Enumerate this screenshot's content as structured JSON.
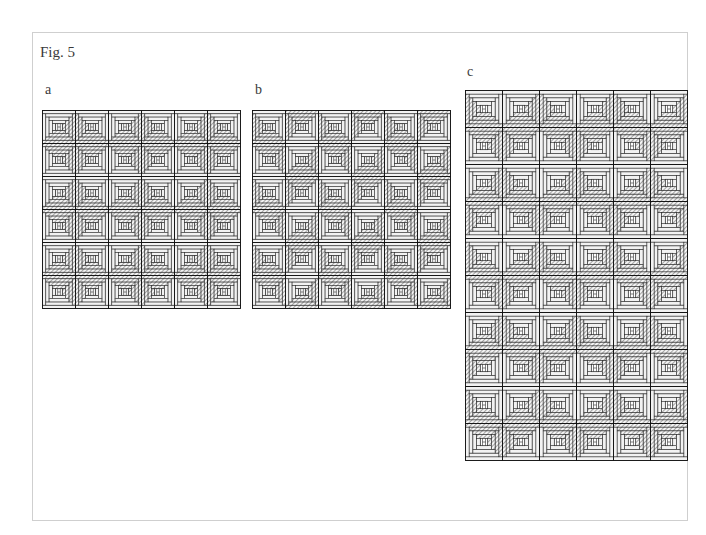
{
  "figure": {
    "title": "Fig. 5"
  },
  "colors": {
    "line": "#2a2a2a",
    "hatch": "#555555",
    "light": "#ffffff",
    "frame": "#cfcfcf"
  },
  "panels": [
    {
      "id": "a",
      "label": "a",
      "label_pos": {
        "x": 45,
        "y": 82
      },
      "pos": {
        "x": 42,
        "y": 110
      },
      "block_size": 33,
      "cols": 6,
      "rows": 6,
      "dark_corners": [
        [
          "br",
          "bl",
          "br",
          "bl",
          "br",
          "bl"
        ],
        [
          "tr",
          "tl",
          "tr",
          "tl",
          "tr",
          "tl"
        ],
        [
          "br",
          "bl",
          "br",
          "bl",
          "br",
          "bl"
        ],
        [
          "tr",
          "tl",
          "tr",
          "tl",
          "tr",
          "tl"
        ],
        [
          "br",
          "bl",
          "br",
          "bl",
          "br",
          "bl"
        ],
        [
          "tr",
          "tl",
          "tr",
          "tl",
          "tr",
          "tl"
        ]
      ]
    },
    {
      "id": "b",
      "label": "b",
      "label_pos": {
        "x": 255,
        "y": 82
      },
      "pos": {
        "x": 252,
        "y": 110
      },
      "block_size": 33,
      "cols": 6,
      "rows": 6,
      "dark_corners": [
        [
          "bl",
          "tl",
          "bl",
          "tl",
          "bl",
          "tl"
        ],
        [
          "tr",
          "br",
          "tr",
          "br",
          "tr",
          "br"
        ],
        [
          "bl",
          "tl",
          "bl",
          "tl",
          "bl",
          "tl"
        ],
        [
          "tr",
          "br",
          "tr",
          "br",
          "tr",
          "br"
        ],
        [
          "bl",
          "tl",
          "bl",
          "tl",
          "bl",
          "tl"
        ],
        [
          "tr",
          "br",
          "tr",
          "br",
          "tr",
          "br"
        ]
      ]
    },
    {
      "id": "c",
      "label": "c",
      "label_pos": {
        "x": 467,
        "y": 64
      },
      "pos": {
        "x": 465,
        "y": 90
      },
      "block_size": 37,
      "cols": 6,
      "rows": 10,
      "dark_corners": [
        [
          "bl",
          "br",
          "bl",
          "br",
          "bl",
          "br"
        ],
        [
          "tr",
          "tl",
          "tr",
          "tl",
          "tr",
          "tl"
        ],
        [
          "br",
          "bl",
          "br",
          "bl",
          "br",
          "bl"
        ],
        [
          "tl",
          "tr",
          "tl",
          "tr",
          "tl",
          "tr"
        ],
        [
          "bl",
          "br",
          "bl",
          "br",
          "bl",
          "br"
        ],
        [
          "tr",
          "tl",
          "tr",
          "tl",
          "tr",
          "tl"
        ],
        [
          "br",
          "bl",
          "br",
          "bl",
          "br",
          "bl"
        ],
        [
          "tl",
          "tr",
          "tl",
          "tr",
          "tl",
          "tr"
        ],
        [
          "bl",
          "br",
          "bl",
          "br",
          "bl",
          "br"
        ],
        [
          "tr",
          "tl",
          "tr",
          "tl",
          "tr",
          "tl"
        ]
      ]
    }
  ]
}
